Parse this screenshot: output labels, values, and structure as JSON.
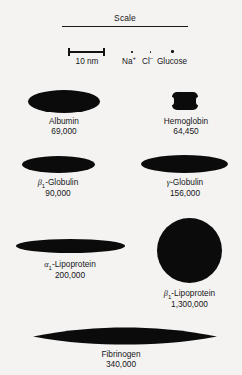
{
  "figure": {
    "scale": {
      "heading": "Scale",
      "bar_label": "10 nm",
      "markers": [
        {
          "id": "sodium",
          "label": "Na",
          "charge": "+",
          "icon": "dot-icon"
        },
        {
          "id": "chloride",
          "label": "Cl",
          "charge": "−",
          "icon": "dot-icon"
        },
        {
          "id": "glucose",
          "label": "Glucose",
          "charge": "",
          "icon": "dot-icon"
        }
      ]
    },
    "molecules": [
      {
        "id": "albumin",
        "name": "Albumin",
        "molecular_weight": "69,000",
        "shape": "ellipse"
      },
      {
        "id": "hemoglobin",
        "name": "Hemoglobin",
        "molecular_weight": "64,450",
        "shape": "notched-rounded-rect"
      },
      {
        "id": "beta1-globulin",
        "name_prefix": "β",
        "name_sub": "1",
        "name_suffix": "-Globulin",
        "molecular_weight": "90,000",
        "shape": "ellipse"
      },
      {
        "id": "gamma-globulin",
        "name_prefix": "γ",
        "name_sub": "",
        "name_suffix": "-Globulin",
        "molecular_weight": "156,000",
        "shape": "ellipse"
      },
      {
        "id": "alpha1-lipoprotein",
        "name_prefix": "α",
        "name_sub": "1",
        "name_suffix": "-Lipoprotein",
        "molecular_weight": "200,000",
        "shape": "ellipse"
      },
      {
        "id": "beta1-lipoprotein",
        "name_prefix": "β",
        "name_sub": "1",
        "name_suffix": "-Lipoprotein",
        "molecular_weight": "1,300,000",
        "shape": "circle"
      },
      {
        "id": "fibrinogen",
        "name": "Fibrinogen",
        "molecular_weight": "340,000",
        "shape": "lens"
      }
    ],
    "colors": {
      "background": "#f4f3f1",
      "ink": "#0b0b0b",
      "text": "#16161a"
    }
  }
}
